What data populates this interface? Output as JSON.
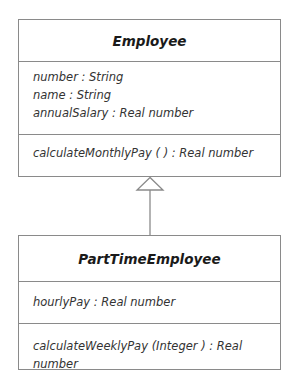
{
  "diagram_type": "UML class diagram",
  "relationship": "generalization",
  "classes": [
    {
      "name": "Employee",
      "attributes": [
        "number : String",
        "name : String",
        "annualSalary : Real number"
      ],
      "operations": [
        "calculateMonthlyPay ( ) : Real number"
      ]
    },
    {
      "name": "PartTimeEmployee",
      "attributes": [
        "hourlyPay : Real number"
      ],
      "operations": [
        "calculateWeeklyPay (Integer ) : Real number"
      ]
    }
  ],
  "colors": {
    "line": "#8a8a8a",
    "text": "#2a2a2a"
  }
}
